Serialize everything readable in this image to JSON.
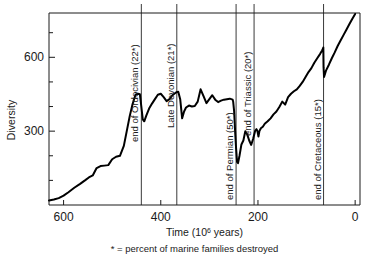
{
  "chart_data": {
    "type": "line",
    "title": "",
    "xlabel": "Time (10⁶ years)",
    "ylabel": "Diversity",
    "footnote": "* = percent of marine families destroyed",
    "xlim": [
      630,
      -10
    ],
    "ylim": [
      0,
      780
    ],
    "x_ticks": [
      600,
      400,
      200,
      0
    ],
    "x_tick_labels": [
      "600",
      "400",
      "200",
      "0"
    ],
    "y_ticks": [
      300,
      600
    ],
    "y_tick_labels": [
      "300",
      "600"
    ],
    "y_minor_ticks": [
      100,
      200,
      400,
      500,
      700
    ],
    "grid": false,
    "legend": "none",
    "series_name": "Marine family diversity",
    "x": [
      630,
      620,
      610,
      600,
      590,
      578,
      566,
      556,
      548,
      540,
      532,
      524,
      516,
      508,
      500,
      492,
      484,
      476,
      470,
      464,
      458,
      452,
      447,
      443,
      440,
      437,
      434,
      430,
      424,
      418,
      412,
      406,
      400,
      394,
      388,
      382,
      376,
      372,
      368,
      364,
      360,
      356,
      352,
      348,
      342,
      336,
      330,
      324,
      318,
      312,
      306,
      300,
      294,
      288,
      282,
      276,
      270,
      264,
      258,
      252,
      251,
      249,
      247,
      245,
      243,
      241,
      238,
      234,
      230,
      226,
      222,
      218,
      214,
      210,
      206,
      203,
      201,
      199,
      197,
      194,
      190,
      186,
      180,
      174,
      168,
      162,
      156,
      150,
      144,
      138,
      132,
      126,
      120,
      114,
      108,
      102,
      96,
      90,
      84,
      78,
      72,
      68,
      66,
      65.5,
      65,
      64,
      60,
      54,
      48,
      42,
      36,
      30,
      24,
      18,
      12,
      6,
      0
    ],
    "y": [
      18,
      22,
      28,
      38,
      52,
      70,
      86,
      100,
      112,
      120,
      150,
      158,
      160,
      162,
      186,
      196,
      200,
      240,
      300,
      360,
      410,
      448,
      452,
      450,
      400,
      348,
      340,
      362,
      392,
      412,
      430,
      448,
      452,
      438,
      422,
      430,
      446,
      452,
      458,
      460,
      430,
      352,
      380,
      396,
      404,
      400,
      402,
      420,
      470,
      442,
      414,
      430,
      446,
      428,
      418,
      424,
      428,
      430,
      432,
      428,
      420,
      380,
      300,
      230,
      175,
      170,
      200,
      246,
      262,
      300,
      286,
      262,
      244,
      268,
      300,
      308,
      300,
      278,
      300,
      312,
      318,
      330,
      340,
      352,
      368,
      380,
      398,
      420,
      408,
      438,
      452,
      462,
      470,
      484,
      500,
      520,
      540,
      556,
      578,
      596,
      614,
      628,
      636,
      640,
      560,
      520,
      546,
      570,
      596,
      620,
      646,
      668,
      690,
      712,
      734,
      756,
      776
    ],
    "events": [
      {
        "label": "end of Ordocivian (22*)",
        "x": 440,
        "name": "ordovician"
      },
      {
        "label": "Late Devonian (21*)",
        "x": 367,
        "name": "devonian"
      },
      {
        "label": "end of Permian (50*)",
        "x": 245,
        "name": "permian"
      },
      {
        "label": "end of Triassic (20*)",
        "x": 208,
        "name": "triassic"
      },
      {
        "label": "end of Cretaceous (15*)",
        "x": 65,
        "name": "cretaceous"
      }
    ]
  },
  "colors": {
    "curve": "#000000",
    "axis": "#1a1a1a",
    "event_line": "#3a3a3a",
    "background": "#ffffff"
  }
}
